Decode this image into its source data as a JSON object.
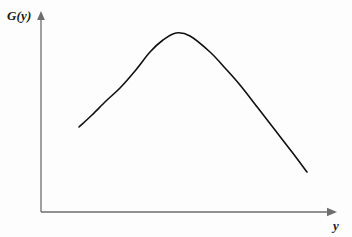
{
  "figure": {
    "background_color": "#fdfdfd",
    "axis_color": "#6e6e6e",
    "curve_color": "#111111"
  },
  "axes": {
    "y_axis": {
      "label": "G(y)",
      "arrow": "arrow-up",
      "origin_x": 41,
      "top_y": 13,
      "bottom_y": 212
    },
    "x_axis": {
      "label": "y",
      "arrow": "arrow-right",
      "origin_y": 212,
      "left_x": 41,
      "right_x": 335
    }
  },
  "chart_data": {
    "type": "line",
    "title": "",
    "subtitle": "",
    "xlabel": "y",
    "ylabel": "G(y)",
    "xlim": [
      0,
      352
    ],
    "ylim": [
      0,
      237
    ],
    "grid": false,
    "legend": null,
    "annotations": [],
    "series": [
      {
        "name": "G(y)",
        "color": "#111111",
        "stroke_width": 1.6,
        "x": [
          79,
          92,
          106,
          120,
          135,
          150,
          163,
          176,
          190,
          210,
          225,
          240,
          258,
          275,
          292,
          307
        ],
        "y": [
          127,
          115,
          101,
          88,
          71,
          52,
          40,
          33,
          36,
          52,
          68,
          85,
          108,
          130,
          152,
          172
        ],
        "endpoints": {
          "left": [
            79,
            127
          ],
          "right": [
            307,
            172
          ]
        },
        "maximum": [
          176,
          33
        ]
      }
    ]
  }
}
